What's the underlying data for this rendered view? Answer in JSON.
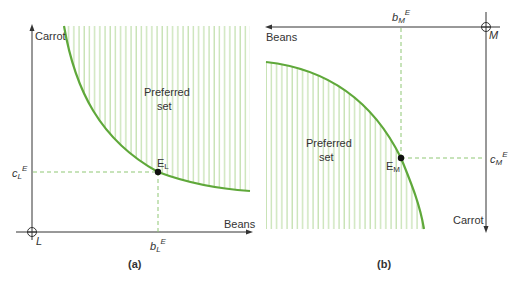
{
  "panels": [
    {
      "id": "a",
      "caption": "(a)",
      "y_axis_label": "Carrot",
      "x_axis_label": "Beans",
      "origin_label": "L",
      "region_label_line1": "Preferred",
      "region_label_line2": "set",
      "point_label": "E",
      "point_label_sub": "L",
      "x_tick_label": "b",
      "x_tick_sub": "L",
      "x_tick_sup": "E",
      "y_tick_label": "c",
      "y_tick_sub": "L",
      "y_tick_sup": "E"
    },
    {
      "id": "b",
      "caption": "(b)",
      "y_axis_label": "Carrot",
      "x_axis_label": "Beans",
      "origin_label": "M",
      "region_label_line1": "Preferred",
      "region_label_line2": "set",
      "point_label": "E",
      "point_label_sub": "M",
      "x_tick_label": "b",
      "x_tick_sub": "M",
      "x_tick_sup": "E",
      "y_tick_label": "c",
      "y_tick_sub": "M",
      "y_tick_sup": "E"
    }
  ],
  "colors": {
    "curve": "#5fa83a",
    "hatch": "#b5d99c",
    "axis": "#333333",
    "dashed": "#8fc774"
  }
}
